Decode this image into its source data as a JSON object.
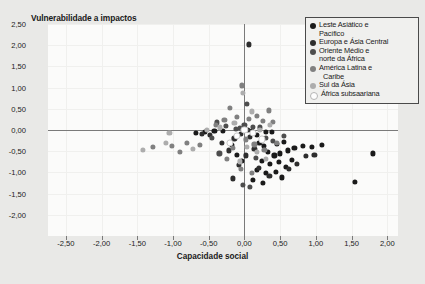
{
  "chart_data": {
    "type": "scatter",
    "title": "Vulnerabilidade a impactos",
    "xlabel": "Capacidade social",
    "ylabel": "Vulnerabilidade a impactos",
    "xlim": [
      -2.75,
      2.15
    ],
    "ylim": [
      -2.5,
      2.5
    ],
    "xticks": [
      "-2,50",
      "-2,00",
      "-1,50",
      "-1,00",
      "-0,50",
      "0,00",
      "0,50",
      "1,00",
      "1,50",
      "2,00"
    ],
    "xtick_values": [
      -2.5,
      -2.0,
      -1.5,
      -1.0,
      -0.5,
      0.0,
      0.5,
      1.0,
      1.5,
      2.0
    ],
    "yticks": [
      "2,50",
      "2,00",
      "1,50",
      "1,00",
      "0,50",
      "0,00",
      "-0,50",
      "-1,00",
      "-1,50",
      "-2,00"
    ],
    "ytick_values": [
      2.5,
      2.0,
      1.5,
      1.0,
      0.5,
      0.0,
      -0.5,
      -1.0,
      -1.5,
      -2.0
    ],
    "grid": false,
    "legend_position": "top-right",
    "series": [
      {
        "name": "Leste Asiático e Pacífico",
        "color": "#1a1a1a",
        "points": [
          [
            0.11,
            -0.02
          ],
          [
            0.17,
            -0.11
          ],
          [
            0.3,
            -0.04
          ],
          [
            0.38,
            -0.05
          ],
          [
            0.21,
            -0.3
          ],
          [
            0.27,
            -0.38
          ],
          [
            0.46,
            -0.33
          ],
          [
            0.55,
            -0.28
          ],
          [
            0.33,
            -0.52
          ],
          [
            0.42,
            -0.6
          ],
          [
            0.5,
            -0.55
          ],
          [
            0.61,
            -0.48
          ],
          [
            0.7,
            -0.42
          ],
          [
            0.82,
            -0.37
          ],
          [
            0.95,
            -0.4
          ],
          [
            1.08,
            -0.35
          ],
          [
            0.24,
            -0.72
          ],
          [
            0.36,
            -0.8
          ],
          [
            0.48,
            -0.76
          ],
          [
            0.58,
            -0.88
          ],
          [
            0.66,
            -0.7
          ],
          [
            0.18,
            -0.95
          ],
          [
            0.3,
            -1.02
          ],
          [
            0.44,
            -0.98
          ],
          [
            0.12,
            -1.18
          ],
          [
            0.26,
            -1.25
          ],
          [
            0.52,
            -1.12
          ],
          [
            1.8,
            -0.55
          ],
          [
            1.55,
            -1.22
          ],
          [
            -0.1,
            -0.58
          ],
          [
            -0.03,
            -0.72
          ],
          [
            -0.18,
            -0.35
          ],
          [
            -0.3,
            -0.02
          ],
          [
            -0.42,
            -0.03
          ],
          [
            -0.55,
            -0.05
          ],
          [
            -0.68,
            -0.06
          ]
        ]
      },
      {
        "name": "Europa e Ásia Central",
        "color": "#2e2e2e",
        "points": [
          [
            0.05,
            0.0
          ],
          [
            0.08,
            -0.16
          ],
          [
            -0.05,
            -0.1
          ],
          [
            -0.14,
            -0.2
          ],
          [
            0.14,
            -0.44
          ],
          [
            -0.22,
            -0.48
          ],
          [
            -0.32,
            -0.3
          ],
          [
            0.02,
            -0.6
          ],
          [
            -0.08,
            -0.82
          ],
          [
            0.2,
            -0.9
          ],
          [
            0.35,
            -1.08
          ],
          [
            -0.16,
            -1.14
          ],
          [
            0.62,
            -0.92
          ],
          [
            0.74,
            -0.8
          ],
          [
            0.86,
            -0.62
          ],
          [
            0.98,
            -0.58
          ],
          [
            0.06,
            2.02
          ],
          [
            -0.48,
            -0.12
          ],
          [
            -0.6,
            -0.1
          ]
        ]
      },
      {
        "name": "Oriente Médio e norte da África",
        "color": "#4d4d4d",
        "points": [
          [
            0.03,
            0.62
          ],
          [
            0.0,
            0.12
          ],
          [
            -0.06,
            0.04
          ],
          [
            0.12,
            0.08
          ],
          [
            0.22,
            0.06
          ],
          [
            -0.12,
            0.02
          ],
          [
            -0.26,
            0.1
          ],
          [
            -0.38,
            0.18
          ],
          [
            -0.45,
            -0.18
          ],
          [
            0.3,
            -0.18
          ],
          [
            0.4,
            -0.26
          ],
          [
            0.55,
            -0.14
          ],
          [
            0.16,
            -0.66
          ],
          [
            -0.02,
            -1.3
          ],
          [
            0.08,
            -1.34
          ],
          [
            -0.35,
            -0.55
          ]
        ]
      },
      {
        "name": "América Latina e Caribe",
        "color": "#808080",
        "points": [
          [
            -0.04,
            1.05
          ],
          [
            -0.2,
            0.52
          ],
          [
            -0.1,
            0.3
          ],
          [
            0.06,
            0.26
          ],
          [
            0.18,
            0.34
          ],
          [
            0.26,
            0.22
          ],
          [
            0.4,
            0.2
          ],
          [
            0.34,
            0.46
          ],
          [
            -0.28,
            0.24
          ],
          [
            -0.4,
            0.12
          ],
          [
            0.02,
            -0.22
          ],
          [
            0.14,
            -0.34
          ],
          [
            0.28,
            -0.46
          ],
          [
            0.46,
            -0.3
          ],
          [
            -0.16,
            -0.42
          ],
          [
            -0.24,
            -0.68
          ],
          [
            -0.05,
            -0.92
          ],
          [
            0.1,
            -1.02
          ],
          [
            -0.62,
            -0.36
          ],
          [
            -0.8,
            -0.3
          ],
          [
            -1.02,
            -0.38
          ],
          [
            -1.28,
            -0.4
          ],
          [
            -0.9,
            -0.52
          ]
        ]
      },
      {
        "name": "Sul da Ásia",
        "color": "#adadad",
        "points": [
          [
            -0.02,
            0.88
          ],
          [
            0.1,
            0.44
          ],
          [
            -0.14,
            0.16
          ],
          [
            0.22,
            0.0
          ],
          [
            0.36,
            0.12
          ],
          [
            -0.34,
            0.06
          ],
          [
            -0.52,
            0.0
          ],
          [
            0.04,
            -0.4
          ],
          [
            0.18,
            -0.52
          ],
          [
            -0.06,
            -0.74
          ],
          [
            0.3,
            -0.68
          ],
          [
            -0.72,
            -0.44
          ],
          [
            -1.1,
            -0.3
          ],
          [
            -1.42,
            -0.46
          ],
          [
            -1.05,
            -0.06
          ]
        ]
      },
      {
        "name": "África subsaariana",
        "color": "#ffffff",
        "points": [
          [
            0.0,
            0.0
          ],
          [
            0.12,
            -0.06
          ],
          [
            -0.1,
            -0.14
          ],
          [
            0.24,
            -0.22
          ],
          [
            -0.2,
            -0.3
          ]
        ]
      }
    ]
  },
  "legend": {
    "items": [
      {
        "lines": [
          "Leste Asiático e",
          "Pacífico"
        ],
        "color": "#1a1a1a"
      },
      {
        "lines": [
          "Europa e Ásia Central"
        ],
        "color": "#2e2e2e"
      },
      {
        "lines": [
          "Oriente Médio e",
          "norte da África"
        ],
        "color": "#4d4d4d"
      },
      {
        "lines": [
          "América Latina e",
          "Caribe"
        ],
        "color": "#808080"
      },
      {
        "lines": [
          "Sul da Ásia"
        ],
        "color": "#adadad"
      },
      {
        "lines": [
          "África subsaariana"
        ],
        "color": "#fdfdfd"
      }
    ]
  }
}
